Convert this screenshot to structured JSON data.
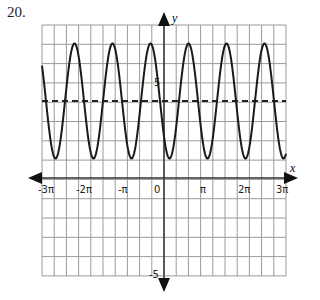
{
  "problem_number": "20.",
  "chart_data": {
    "type": "line",
    "title": "",
    "xlabel": "x",
    "ylabel": "y",
    "x_tick_labels": [
      "-3π",
      "-2π",
      "-π",
      "0",
      "π",
      "2π",
      "3π"
    ],
    "y_tick_labels": [
      "5",
      "-5"
    ],
    "xlim": [
      "-3π",
      "3π"
    ],
    "ylim": [
      -5,
      7.5
    ],
    "grid": true,
    "series": [
      {
        "name": "curve",
        "style": "solid",
        "function": "sinusoid",
        "midline": 4,
        "amplitude": 3,
        "max": 7,
        "min": 1,
        "period_approx": "π",
        "peaks_visible": 6
      },
      {
        "name": "midline",
        "style": "dashed",
        "y": 4
      }
    ]
  }
}
